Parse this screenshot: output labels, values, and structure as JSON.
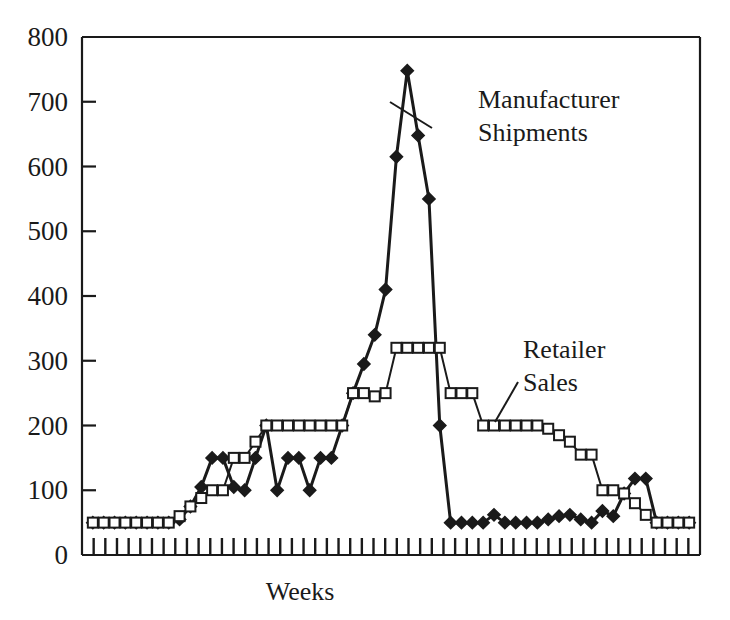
{
  "chart_data": {
    "type": "line",
    "title": "",
    "xlabel": "Weeks",
    "ylabel": "",
    "ylim": [
      0,
      800
    ],
    "ytick_labels": [
      "0",
      "100",
      "200",
      "300",
      "400",
      "500",
      "600",
      "700",
      "800"
    ],
    "ytick_values": [
      0,
      100,
      200,
      300,
      400,
      500,
      600,
      700,
      800
    ],
    "grid": false,
    "legend_position": "inline-annotations",
    "x_tick_count": 52,
    "x_tick_labels_shown": false,
    "colors": {
      "line": "#1a1a1a",
      "manufacturer_marker_fill": "#1a1a1a",
      "retailer_marker_fill": "#ffffff",
      "background": "#ffffff",
      "axis": "#1a1a1a"
    },
    "series": [
      {
        "name": "Manufacturer Shipments",
        "marker": "filled-diamond",
        "annotation": "Manufacturer\nShipments",
        "values": [
          50,
          50,
          50,
          50,
          50,
          50,
          50,
          50,
          55,
          75,
          105,
          150,
          150,
          105,
          100,
          150,
          200,
          100,
          150,
          150,
          100,
          150,
          150,
          200,
          250,
          295,
          340,
          410,
          615,
          748,
          648,
          550,
          200,
          50,
          50,
          50,
          50,
          62,
          50,
          50,
          50,
          50,
          55,
          60,
          62,
          55,
          50,
          68,
          60,
          95,
          118,
          118,
          50,
          50,
          50,
          50
        ]
      },
      {
        "name": "Retailer Sales",
        "marker": "open-square",
        "annotation": "Retailer\nSales",
        "values": [
          50,
          50,
          50,
          50,
          50,
          50,
          50,
          50,
          60,
          75,
          88,
          100,
          100,
          150,
          150,
          175,
          200,
          200,
          200,
          200,
          200,
          200,
          200,
          200,
          250,
          250,
          245,
          250,
          320,
          320,
          320,
          320,
          320,
          250,
          250,
          250,
          200,
          200,
          200,
          200,
          200,
          200,
          195,
          185,
          175,
          155,
          155,
          100,
          100,
          95,
          80,
          62,
          50,
          50,
          50,
          50
        ]
      }
    ]
  },
  "annotations": [
    {
      "id": "manufacturer",
      "line1": "Manufacturer",
      "line2": "Shipments",
      "text_x": 478,
      "text_y": 108,
      "leader": {
        "x1": 432,
        "y1": 128,
        "x2": 390,
        "y2": 102
      }
    },
    {
      "id": "retailer",
      "line1": "Retailer",
      "line2": "Sales",
      "text_x": 523,
      "text_y": 358,
      "leader": {
        "x1": 518,
        "y1": 382,
        "x2": 495,
        "y2": 422
      }
    }
  ],
  "axis": {
    "x_title": "Weeks",
    "x_title_x": 300,
    "x_title_y": 600
  }
}
